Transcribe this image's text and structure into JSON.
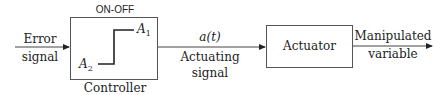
{
  "diagram": {
    "input": {
      "line1": "Error",
      "line2": "signal"
    },
    "controller": {
      "mode": "ON-OFF",
      "label": "Controller",
      "high": "A",
      "high_sub": "1",
      "low": "A",
      "low_sub": "2"
    },
    "actuating": {
      "symbol": "a(t)",
      "line1": "Actuating",
      "line2": "signal"
    },
    "actuator": {
      "label": "Actuator"
    },
    "output": {
      "line1": "Manipulated",
      "line2": "variable"
    }
  }
}
